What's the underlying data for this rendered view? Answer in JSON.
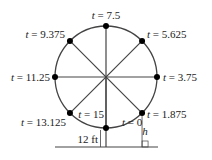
{
  "diagram": {
    "colors": {
      "stroke": "#444444",
      "dot": "#000000",
      "text": "#222222"
    },
    "wheel": {
      "cx": 106,
      "cy": 77,
      "r": 51
    },
    "points": [
      {
        "label": "t = 0",
        "angle_deg": -90,
        "lx": 122,
        "ly": 126,
        "anchor": "start"
      },
      {
        "label": "t = 1.875",
        "angle_deg": -45,
        "lx": 147,
        "ly": 118,
        "anchor": "start"
      },
      {
        "label": "t = 3.75",
        "angle_deg": 0,
        "lx": 163,
        "ly": 81,
        "anchor": "start"
      },
      {
        "label": "t = 5.625",
        "angle_deg": 45,
        "lx": 147,
        "ly": 38,
        "anchor": "start"
      },
      {
        "label": "t = 7.5",
        "angle_deg": 90,
        "lx": 106,
        "ly": 19,
        "anchor": "middle"
      },
      {
        "label": "t = 9.375",
        "angle_deg": 135,
        "lx": 65,
        "ly": 38,
        "anchor": "end"
      },
      {
        "label": "t = 11.25",
        "angle_deg": 180,
        "lx": 50,
        "ly": 81,
        "anchor": "end"
      },
      {
        "label": "t = 13.125",
        "angle_deg": 225,
        "lx": 66,
        "ly": 126,
        "anchor": "end"
      },
      {
        "label": "t = 15",
        "angle_deg": -90,
        "lx": 104,
        "ly": 118,
        "anchor": "end"
      }
    ],
    "height_label": "12 ft",
    "h_label": "h"
  }
}
